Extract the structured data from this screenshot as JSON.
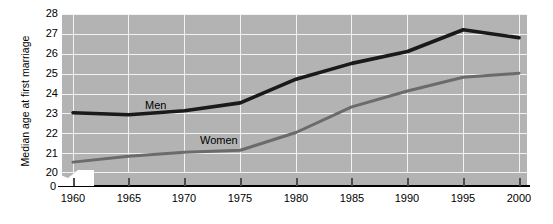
{
  "chart_data": {
    "type": "line",
    "title": "",
    "xlabel": "",
    "ylabel": "Median age at first marriage",
    "x": [
      1960,
      1965,
      1970,
      1975,
      1980,
      1985,
      1990,
      1995,
      2000
    ],
    "xtick_labels": [
      "1960",
      "1965",
      "1970",
      "1975",
      "1980",
      "1985",
      "1990",
      "1995",
      "2000"
    ],
    "ytick_labels": [
      "28",
      "27",
      "26",
      "25",
      "24",
      "23",
      "22",
      "21",
      "20"
    ],
    "ytick_values": [
      28,
      27,
      26,
      25,
      24,
      23,
      22,
      21,
      20
    ],
    "axis_break_label": "0",
    "ylim": [
      20,
      28
    ],
    "xlim": [
      1960,
      2000
    ],
    "grid": true,
    "legend_position": "inline-annotation",
    "series": [
      {
        "name": "Men",
        "label": "Men",
        "color": "#1a1a1a",
        "values": [
          23.0,
          22.9,
          23.1,
          23.5,
          24.7,
          25.5,
          26.1,
          27.2,
          26.8
        ]
      },
      {
        "name": "Women",
        "label": "Women",
        "color": "#6b6b6b",
        "values": [
          20.5,
          20.8,
          21.0,
          21.1,
          22.0,
          23.3,
          24.1,
          24.8,
          25.0
        ]
      }
    ],
    "colors": {
      "plot_background": "#b3b3b3",
      "gridline": "#f2f2f2",
      "page_background": "#ffffff",
      "axis": "#000000",
      "men_line": "#1a1a1a",
      "women_line": "#6b6b6b"
    }
  }
}
